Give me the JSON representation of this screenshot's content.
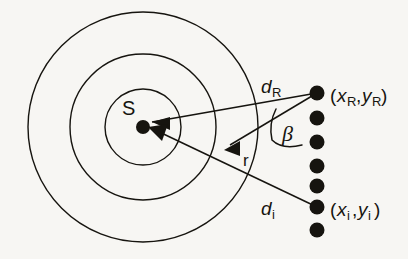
{
  "figure": {
    "kind": "geometry-diagram",
    "background_color": "#f7f6f3",
    "ink_color": "#16140f"
  },
  "labels": {
    "source": "S",
    "radius_vector": "r",
    "angle": "β",
    "distance_reference": {
      "symbol": "d",
      "subscript": "R"
    },
    "distance_i": {
      "symbol": "d",
      "subscript": "i"
    },
    "point_reference": {
      "open": "(",
      "x_symbol": "x",
      "x_subscript": "R",
      "comma": ",",
      "y_symbol": "y",
      "y_subscript": "R",
      "close": ")"
    },
    "point_i": {
      "open": "(",
      "x_symbol": "x",
      "x_subscript": "i",
      "comma": ",",
      "y_symbol": "y",
      "y_subscript": "i",
      "close": ")"
    }
  },
  "geometry": {
    "center": {
      "x": 143,
      "y": 127
    },
    "circles": [
      {
        "name": "inner-circle",
        "radius": 38
      },
      {
        "name": "middle-circle",
        "radius": 73
      },
      {
        "name": "outer-circle",
        "radius": 115
      }
    ],
    "source_dot_radius": 7,
    "receiver_dot_radius": 7.5,
    "receiver_column_x": 317,
    "receivers": [
      {
        "name": "receiver-1",
        "y": 93
      },
      {
        "name": "receiver-2",
        "y": 118
      },
      {
        "name": "receiver-3",
        "y": 142
      },
      {
        "name": "receiver-4",
        "y": 166
      },
      {
        "name": "receiver-5",
        "y": 186
      },
      {
        "name": "receiver-6",
        "y": 207
      },
      {
        "name": "receiver-7",
        "y": 230
      }
    ],
    "rays": [
      {
        "name": "ray-to-reference",
        "from": {
          "x": 317,
          "y": 93
        },
        "to": {
          "x": 146,
          "y": 123
        }
      },
      {
        "name": "ray-to-point-i",
        "from": {
          "x": 317,
          "y": 207
        },
        "to": {
          "x": 148,
          "y": 127
        }
      },
      {
        "name": "ray-radius-vector",
        "from": {
          "x": 317,
          "y": 93
        },
        "to": {
          "x": 225,
          "y": 148
        }
      }
    ],
    "angle_arc": {
      "name": "beta-arc",
      "vertex": {
        "x": 317,
        "y": 93
      },
      "radius": 48
    }
  },
  "label_positions": {
    "source": {
      "x": 128,
      "y": 113
    },
    "radius_vector": {
      "x": 240,
      "y": 161
    },
    "angle": {
      "x": 283,
      "y": 135
    },
    "distance_reference": {
      "x": 262,
      "y": 92
    },
    "distance_i": {
      "x": 262,
      "y": 214
    },
    "point_reference": {
      "x": 330,
      "y": 101
    },
    "point_i": {
      "x": 330,
      "y": 215
    }
  }
}
